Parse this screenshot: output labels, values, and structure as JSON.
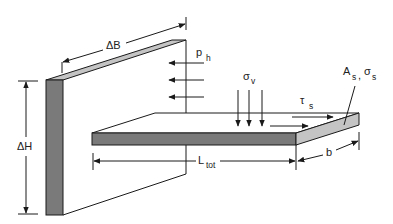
{
  "diagram": {
    "type": "engineering-schematic",
    "colors": {
      "line": "#1a1a1a",
      "dark_face": "#7a7a7a",
      "light_face": "#c4c4c4",
      "background": "#ffffff"
    },
    "labels": {
      "delta_b": {
        "main": "ΔB",
        "sub": ""
      },
      "delta_h": {
        "main": "ΔH",
        "sub": ""
      },
      "p_h": {
        "main": "p",
        "sub": "h"
      },
      "sigma_v": {
        "main": "σ",
        "sub": "v"
      },
      "tau_s": {
        "main": "τ",
        "sub": "s"
      },
      "a_s": {
        "main": "A",
        "sub": "s"
      },
      "a_s_sep": ",",
      "sigma_s": {
        "main": "σ",
        "sub": "s"
      },
      "l_tot": {
        "main": "L",
        "sub": "tot"
      },
      "b": {
        "main": "b",
        "sub": ""
      }
    },
    "components": [
      "wall",
      "plate",
      "horizontal-pressure-arrows",
      "vertical-stress-arrows",
      "shear-arrows",
      "dimension-delta-b",
      "dimension-delta-h",
      "dimension-l-tot",
      "dimension-b"
    ]
  }
}
